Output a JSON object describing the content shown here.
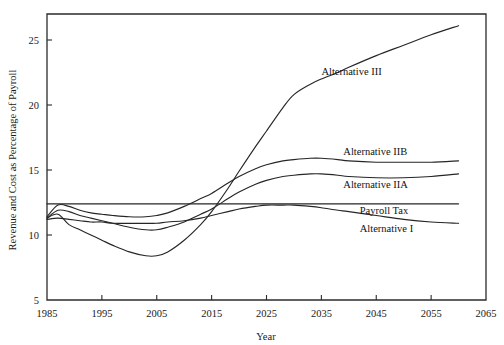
{
  "chart_data": {
    "type": "line",
    "title": "",
    "xlabel": "Year",
    "ylabel": "Revenue and Cost as Percentage of Payroll",
    "xlim": [
      1985,
      2065
    ],
    "ylim": [
      5,
      27
    ],
    "xticks": [
      1985,
      1995,
      2005,
      2015,
      2025,
      2035,
      2045,
      2055,
      2065
    ],
    "yticks": [
      5,
      10,
      15,
      20,
      25
    ],
    "grid": false,
    "legend": "inline-right-labels",
    "x": [
      1985,
      1987,
      1989,
      1991,
      1993,
      1995,
      1997,
      2000,
      2003,
      2005,
      2007,
      2010,
      2013,
      2015,
      2018,
      2020,
      2023,
      2025,
      2028,
      2030,
      2033,
      2035,
      2038,
      2040,
      2045,
      2050,
      2055,
      2060
    ],
    "series": [
      {
        "name": "Alternative III",
        "label": "Alternative III",
        "values": [
          11.3,
          11.6,
          10.8,
          10.4,
          10.0,
          9.6,
          9.2,
          8.7,
          8.4,
          8.4,
          8.7,
          9.6,
          10.8,
          11.8,
          13.6,
          14.9,
          16.8,
          18.0,
          19.8,
          20.8,
          21.6,
          22.0,
          22.5,
          22.9,
          23.8,
          24.6,
          25.4,
          26.1
        ],
        "label_x": 2035,
        "label_y": 22.6
      },
      {
        "name": "Alternative IIB",
        "label": "Alternative IIB",
        "values": [
          11.4,
          12.3,
          12.2,
          11.9,
          11.7,
          11.6,
          11.5,
          11.4,
          11.4,
          11.5,
          11.7,
          12.2,
          12.8,
          13.2,
          14.0,
          14.5,
          15.1,
          15.4,
          15.7,
          15.8,
          15.9,
          15.9,
          15.8,
          15.7,
          15.6,
          15.6,
          15.6,
          15.7
        ],
        "label_x": 2039,
        "label_y": 16.4
      },
      {
        "name": "Alternative IIA",
        "label": "Alternative IIA",
        "values": [
          11.3,
          11.9,
          11.8,
          11.5,
          11.3,
          11.1,
          10.9,
          10.6,
          10.4,
          10.4,
          10.6,
          11.0,
          11.6,
          12.0,
          12.8,
          13.3,
          13.9,
          14.2,
          14.5,
          14.6,
          14.7,
          14.7,
          14.6,
          14.5,
          14.4,
          14.4,
          14.5,
          14.7
        ],
        "label_x": 2039,
        "label_y": 13.9
      },
      {
        "name": "Payroll Tax",
        "label": "Payroll Tax",
        "values": [
          12.4,
          12.4,
          12.4,
          12.4,
          12.4,
          12.4,
          12.4,
          12.4,
          12.4,
          12.4,
          12.4,
          12.4,
          12.4,
          12.4,
          12.4,
          12.4,
          12.4,
          12.4,
          12.4,
          12.4,
          12.4,
          12.4,
          12.4,
          12.4,
          12.4,
          12.4,
          12.4,
          12.4
        ],
        "label_x": 2042,
        "label_y": 11.9
      },
      {
        "name": "Alternative I",
        "label": "Alternative I",
        "values": [
          11.2,
          11.3,
          11.2,
          11.1,
          11.0,
          11.0,
          10.9,
          10.9,
          10.9,
          10.9,
          11.0,
          11.1,
          11.3,
          11.5,
          11.8,
          12.0,
          12.2,
          12.3,
          12.3,
          12.3,
          12.2,
          12.1,
          11.9,
          11.8,
          11.5,
          11.2,
          11.0,
          10.9
        ],
        "label_x": 2042,
        "label_y": 10.5
      }
    ]
  }
}
